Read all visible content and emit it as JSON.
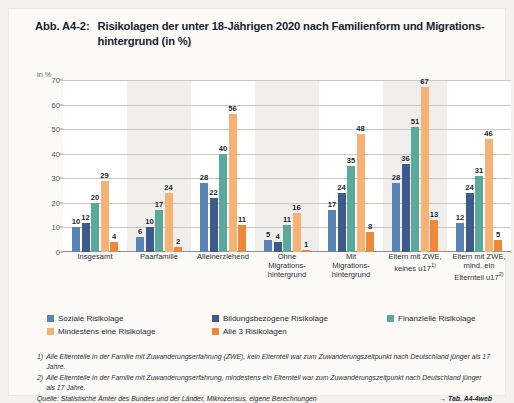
{
  "figure": {
    "number": "Abb. A4-2:",
    "title": "Risikolagen der unter 18-Jährigen 2020 nach Familienform und Migrations-hintergrund (in %)"
  },
  "chart_data": {
    "type": "bar",
    "xlabel": "",
    "ylabel": "in %",
    "ylim": [
      0,
      70
    ],
    "yticks": [
      0,
      10,
      20,
      30,
      40,
      50,
      60,
      70
    ],
    "grid": true,
    "legend_position": "bottom-left",
    "categories": [
      "Insgesamt",
      "Paarfamilie",
      "Alleinerziehend",
      "Ohne Migrations-hintergrund",
      "Mit Migrations-hintergrund",
      "Eltern mit ZWE, keines u17",
      "Eltern mit ZWE, mind. ein Elternteil u17"
    ],
    "series": [
      {
        "name": "Soziale Risikolage",
        "color": "#5b84b5",
        "values": [
          10,
          6,
          28,
          5,
          17,
          28,
          12
        ]
      },
      {
        "name": "Bildungsbezogene Risikolage",
        "color": "#3c5a8c",
        "values": [
          12,
          10,
          22,
          4,
          24,
          36,
          24
        ]
      },
      {
        "name": "Finanzielle Risikolage",
        "color": "#5aa99c",
        "values": [
          20,
          17,
          40,
          11,
          35,
          51,
          31
        ]
      },
      {
        "name": "Mindestens eine Risikolage",
        "color": "#f5b274",
        "values": [
          29,
          24,
          56,
          16,
          48,
          67,
          46
        ]
      },
      {
        "name": "Alle 3 Risikolagen",
        "color": "#f0883a",
        "values": [
          4,
          2,
          11,
          1,
          8,
          13,
          5
        ]
      }
    ]
  },
  "xlabels": [
    {
      "lines": [
        "Insgesamt"
      ],
      "sup": ""
    },
    {
      "lines": [
        "Paarfamilie"
      ],
      "sup": ""
    },
    {
      "lines": [
        "Alleinerziehend"
      ],
      "sup": ""
    },
    {
      "lines": [
        "Ohne",
        "Migrations-",
        "hintergrund"
      ],
      "sup": ""
    },
    {
      "lines": [
        "Mit",
        "Migrations-",
        "hintergrund"
      ],
      "sup": ""
    },
    {
      "lines": [
        "Eltern mit ZWE,",
        "keines u17"
      ],
      "sup": "1)"
    },
    {
      "lines": [
        "Eltern mit ZWE,",
        "mind. ein",
        "Elternteil u17"
      ],
      "sup": "2)"
    }
  ],
  "axis": {
    "unit": "in %"
  },
  "notes": [
    {
      "num": "1)",
      "text": "Alle Elternteile in der Familie mit Zuwanderungserfahrung (ZWE), kein Elternteil war zum Zuwanderungszeitpunkt nach Deutschland jünger als 17 Jahre."
    },
    {
      "num": "2)",
      "text": "Alle Elternteile in der Familie mit Zuwanderungserfahrung, mindestens ein Elternteil war zum Zuwanderungszeitpunkt nach Deutschland jünger als 17 Jahre."
    }
  ],
  "source": "Quelle: Statistische Ämter des Bundes und der Länder, Mikrozensus, eigene Berechnungen",
  "table_ref": "→ Tab. A4-4web",
  "colors": {
    "page_background": "#f3f2ee",
    "sheet_background": "#fbfaf7",
    "plot_background": "#ffffff",
    "band": "#eceae5",
    "grid": "#c9c7c2",
    "text": "#1f2a33"
  }
}
